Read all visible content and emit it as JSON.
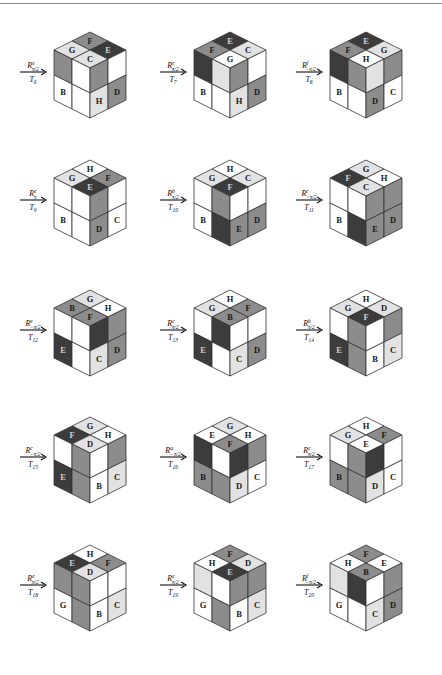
{
  "header": {
    "running_head": "' '  '"
  },
  "palette": {
    "W": "#ffffff",
    "L": "#e2e2e2",
    "M": "#8c8c8c",
    "D": "#3c3c3c",
    "stroke": "#333333",
    "text": "#1a1a1a"
  },
  "layout": {
    "col_x": [
      90,
      230,
      366
    ],
    "row_y": [
      32,
      160,
      290,
      417,
      545
    ],
    "half_width": 36,
    "top_half_height": 18,
    "side_height": 50
  },
  "panels": [
    {
      "id": "T6",
      "operator": "R^e_{π/2}",
      "op_base": "R",
      "op_sup": "e",
      "op_sub": "π/2",
      "transform": "T",
      "transform_sub": "6",
      "top": [
        {
          "c": "F",
          "f": "M",
          "l": "F"
        },
        {
          "c": "D",
          "f": "D",
          "l": "E"
        },
        {
          "c": "L",
          "f": "L",
          "l": "G"
        },
        {
          "c": "L",
          "f": "L",
          "l": "C"
        }
      ],
      "left": [
        {
          "f": "M",
          "l": ""
        },
        {
          "f": "W",
          "l": ""
        },
        {
          "f": "W",
          "l": "B"
        },
        {
          "f": "W",
          "l": ""
        }
      ],
      "right": [
        {
          "f": "M",
          "l": ""
        },
        {
          "f": "W",
          "l": ""
        },
        {
          "f": "L",
          "l": "H"
        },
        {
          "f": "M",
          "l": "D"
        }
      ]
    },
    {
      "id": "T7",
      "operator": "R^c_{π/2}",
      "op_base": "R",
      "op_sup": "c",
      "op_sub": "π/2",
      "transform": "T",
      "transform_sub": "7",
      "top": [
        {
          "f": "D",
          "l": "E"
        },
        {
          "f": "L",
          "l": "C"
        },
        {
          "f": "M",
          "l": "F"
        },
        {
          "f": "W",
          "l": "G"
        }
      ],
      "left": [
        {
          "f": "D",
          "l": ""
        },
        {
          "f": "L",
          "l": ""
        },
        {
          "f": "W",
          "l": "B"
        },
        {
          "f": "W",
          "l": ""
        }
      ],
      "right": [
        {
          "f": "M",
          "l": ""
        },
        {
          "f": "W",
          "l": ""
        },
        {
          "f": "L",
          "l": "H"
        },
        {
          "f": "M",
          "l": "D"
        }
      ]
    },
    {
      "id": "T8",
      "operator": "R^f_{-π/2}",
      "op_base": "R",
      "op_sup": "f",
      "op_sub": "−π/2",
      "transform": "T",
      "transform_sub": "8",
      "top": [
        {
          "f": "D",
          "l": "E"
        },
        {
          "f": "L",
          "l": "G"
        },
        {
          "f": "M",
          "l": "F"
        },
        {
          "f": "W",
          "l": "H"
        }
      ],
      "left": [
        {
          "f": "D",
          "l": ""
        },
        {
          "f": "M",
          "l": ""
        },
        {
          "f": "W",
          "l": "B"
        },
        {
          "f": "W",
          "l": ""
        }
      ],
      "right": [
        {
          "f": "L",
          "l": ""
        },
        {
          "f": "M",
          "l": ""
        },
        {
          "f": "M",
          "l": "D"
        },
        {
          "f": "W",
          "l": "C"
        }
      ]
    },
    {
      "id": "T9",
      "operator": "R^e_{π}",
      "op_base": "R",
      "op_sup": "e",
      "op_sub": "π",
      "transform": "T",
      "transform_sub": "9",
      "top": [
        {
          "f": "W",
          "l": "H"
        },
        {
          "f": "M",
          "l": "F"
        },
        {
          "f": "L",
          "l": "G"
        },
        {
          "f": "D",
          "l": "E"
        }
      ],
      "left": [
        {
          "f": "W",
          "l": ""
        },
        {
          "f": "W",
          "l": ""
        },
        {
          "f": "W",
          "l": "B"
        },
        {
          "f": "W",
          "l": ""
        }
      ],
      "right": [
        {
          "f": "M",
          "l": ""
        },
        {
          "f": "W",
          "l": ""
        },
        {
          "f": "M",
          "l": "D"
        },
        {
          "f": "W",
          "l": "C"
        }
      ]
    },
    {
      "id": "T10",
      "operator": "R^b_{π/2}",
      "op_base": "R",
      "op_sup": "b",
      "op_sub": "π/2",
      "transform": "T",
      "transform_sub": "10",
      "top": [
        {
          "f": "W",
          "l": "H"
        },
        {
          "f": "L",
          "l": "C"
        },
        {
          "f": "L",
          "l": "G"
        },
        {
          "f": "D",
          "l": "F"
        }
      ],
      "left": [
        {
          "f": "W",
          "l": ""
        },
        {
          "f": "M",
          "l": ""
        },
        {
          "f": "W",
          "l": "B"
        },
        {
          "f": "D",
          "l": ""
        }
      ],
      "right": [
        {
          "f": "W",
          "l": ""
        },
        {
          "f": "W",
          "l": ""
        },
        {
          "f": "M",
          "l": "E"
        },
        {
          "f": "M",
          "l": "D"
        }
      ]
    },
    {
      "id": "T11",
      "operator": "R^c_{-π/2}",
      "op_base": "R",
      "op_sup": "c",
      "op_sub": "−π/2",
      "transform": "T",
      "transform_sub": "11",
      "top": [
        {
          "f": "L",
          "l": "G"
        },
        {
          "f": "W",
          "l": "H"
        },
        {
          "f": "D",
          "l": "F"
        },
        {
          "f": "L",
          "l": "C"
        }
      ],
      "left": [
        {
          "f": "W",
          "l": ""
        },
        {
          "f": "W",
          "l": ""
        },
        {
          "f": "W",
          "l": "B"
        },
        {
          "f": "D",
          "l": ""
        }
      ],
      "right": [
        {
          "f": "M",
          "l": ""
        },
        {
          "f": "M",
          "l": ""
        },
        {
          "f": "M",
          "l": "E"
        },
        {
          "f": "M",
          "l": "D"
        }
      ]
    },
    {
      "id": "T12",
      "operator": "R^e_{-π/2}",
      "op_base": "R",
      "op_sup": "e",
      "op_sub": "−π/2",
      "transform": "T",
      "transform_sub": "12",
      "top": [
        {
          "f": "L",
          "l": "G"
        },
        {
          "f": "W",
          "l": "H"
        },
        {
          "f": "M",
          "l": "B"
        },
        {
          "f": "M",
          "l": "F"
        }
      ],
      "left": [
        {
          "f": "W",
          "l": ""
        },
        {
          "f": "W",
          "l": ""
        },
        {
          "f": "D",
          "l": "E"
        },
        {
          "f": "W",
          "l": ""
        }
      ],
      "right": [
        {
          "f": "D",
          "l": ""
        },
        {
          "f": "M",
          "l": ""
        },
        {
          "f": "L",
          "l": "C"
        },
        {
          "f": "M",
          "l": "D"
        }
      ]
    },
    {
      "id": "T13",
      "operator": "R^c_{π/2}",
      "op_base": "R",
      "op_sup": "c",
      "op_sub": "π/2",
      "transform": "T",
      "transform_sub": "13",
      "top": [
        {
          "f": "W",
          "l": "H"
        },
        {
          "f": "M",
          "l": "F"
        },
        {
          "f": "L",
          "l": "G"
        },
        {
          "f": "M",
          "l": "B"
        }
      ],
      "left": [
        {
          "f": "W",
          "l": ""
        },
        {
          "f": "D",
          "l": ""
        },
        {
          "f": "D",
          "l": "E"
        },
        {
          "f": "W",
          "l": ""
        }
      ],
      "right": [
        {
          "f": "W",
          "l": ""
        },
        {
          "f": "W",
          "l": ""
        },
        {
          "f": "L",
          "l": "C"
        },
        {
          "f": "M",
          "l": "D"
        }
      ]
    },
    {
      "id": "T14",
      "operator": "R^b_{π/2}",
      "op_base": "R",
      "op_sup": "b",
      "op_sub": "π/2",
      "transform": "T",
      "transform_sub": "14",
      "top": [
        {
          "f": "W",
          "l": "H"
        },
        {
          "f": "L",
          "l": "D"
        },
        {
          "f": "L",
          "l": "G"
        },
        {
          "f": "D",
          "l": "F"
        }
      ],
      "left": [
        {
          "f": "W",
          "l": ""
        },
        {
          "f": "M",
          "l": ""
        },
        {
          "f": "D",
          "l": "E"
        },
        {
          "f": "M",
          "l": ""
        }
      ],
      "right": [
        {
          "f": "W",
          "l": ""
        },
        {
          "f": "M",
          "l": ""
        },
        {
          "f": "W",
          "l": "B"
        },
        {
          "f": "L",
          "l": "C"
        }
      ]
    },
    {
      "id": "T15",
      "operator": "R^c_{-π/2}",
      "op_base": "R",
      "op_sup": "c",
      "op_sub": "−π/2",
      "transform": "T",
      "transform_sub": "15",
      "top": [
        {
          "f": "L",
          "l": "G"
        },
        {
          "f": "W",
          "l": "H"
        },
        {
          "f": "D",
          "l": "F"
        },
        {
          "f": "L",
          "l": "D"
        }
      ],
      "left": [
        {
          "f": "W",
          "l": ""
        },
        {
          "f": "M",
          "l": ""
        },
        {
          "f": "D",
          "l": "E"
        },
        {
          "f": "M",
          "l": ""
        }
      ],
      "right": [
        {
          "f": "W",
          "l": ""
        },
        {
          "f": "M",
          "l": ""
        },
        {
          "f": "W",
          "l": "B"
        },
        {
          "f": "L",
          "l": "C"
        }
      ]
    },
    {
      "id": "T16",
      "operator": "R^a_{-π/2}",
      "op_base": "R",
      "op_sup": "a",
      "op_sub": "−π/2",
      "transform": "T",
      "transform_sub": "16",
      "top": [
        {
          "f": "L",
          "l": "G"
        },
        {
          "f": "W",
          "l": "H"
        },
        {
          "f": "W",
          "l": "E"
        },
        {
          "f": "M",
          "l": "F"
        }
      ],
      "left": [
        {
          "f": "D",
          "l": ""
        },
        {
          "f": "W",
          "l": ""
        },
        {
          "f": "M",
          "l": "B"
        },
        {
          "f": "M",
          "l": ""
        }
      ],
      "right": [
        {
          "f": "D",
          "l": ""
        },
        {
          "f": "M",
          "l": ""
        },
        {
          "f": "L",
          "l": "D"
        },
        {
          "f": "W",
          "l": "C"
        }
      ]
    },
    {
      "id": "T17",
      "operator": "R^c_{π/2}",
      "op_base": "R",
      "op_sup": "c",
      "op_sub": "π/2",
      "transform": "T",
      "transform_sub": "17",
      "top": [
        {
          "f": "W",
          "l": "H"
        },
        {
          "f": "M",
          "l": "F"
        },
        {
          "f": "L",
          "l": "G"
        },
        {
          "f": "W",
          "l": "E"
        }
      ],
      "left": [
        {
          "f": "W",
          "l": ""
        },
        {
          "f": "M",
          "l": ""
        },
        {
          "f": "M",
          "l": "B"
        },
        {
          "f": "M",
          "l": ""
        }
      ],
      "right": [
        {
          "f": "D",
          "l": ""
        },
        {
          "f": "W",
          "l": ""
        },
        {
          "f": "L",
          "l": "D"
        },
        {
          "f": "W",
          "l": "C"
        }
      ]
    },
    {
      "id": "T18",
      "operator": "R^e_{π/2}",
      "op_base": "R",
      "op_sup": "e",
      "op_sub": "π/2",
      "transform": "T",
      "transform_sub": "18",
      "top": [
        {
          "f": "W",
          "l": "H"
        },
        {
          "f": "M",
          "l": "F"
        },
        {
          "f": "D",
          "l": "E"
        },
        {
          "f": "L",
          "l": "D"
        }
      ],
      "left": [
        {
          "f": "M",
          "l": ""
        },
        {
          "f": "M",
          "l": ""
        },
        {
          "f": "W",
          "l": "G"
        },
        {
          "f": "M",
          "l": ""
        }
      ],
      "right": [
        {
          "f": "W",
          "l": ""
        },
        {
          "f": "W",
          "l": ""
        },
        {
          "f": "W",
          "l": "B"
        },
        {
          "f": "L",
          "l": "C"
        }
      ]
    },
    {
      "id": "T19",
      "operator": "R^e_{π/2}",
      "op_base": "R",
      "op_sup": "e",
      "op_sub": "π/2",
      "transform": "T",
      "transform_sub": "19",
      "top": [
        {
          "f": "M",
          "l": "F"
        },
        {
          "f": "L",
          "l": "D"
        },
        {
          "f": "W",
          "l": "H"
        },
        {
          "f": "D",
          "l": "E"
        }
      ],
      "left": [
        {
          "f": "L",
          "l": ""
        },
        {
          "f": "W",
          "l": ""
        },
        {
          "f": "W",
          "l": "G"
        },
        {
          "f": "M",
          "l": ""
        }
      ],
      "right": [
        {
          "f": "M",
          "l": ""
        },
        {
          "f": "M",
          "l": ""
        },
        {
          "f": "W",
          "l": "B"
        },
        {
          "f": "L",
          "l": "C"
        }
      ]
    },
    {
      "id": "T20",
      "operator": "R^f_{-π/2}",
      "op_base": "R",
      "op_sup": "f",
      "op_sub": "−π/2",
      "transform": "T",
      "transform_sub": "20",
      "top": [
        {
          "f": "M",
          "l": "F"
        },
        {
          "f": "W",
          "l": "E"
        },
        {
          "f": "W",
          "l": "H"
        },
        {
          "f": "M",
          "l": "B"
        }
      ],
      "left": [
        {
          "f": "L",
          "l": ""
        },
        {
          "f": "D",
          "l": ""
        },
        {
          "f": "W",
          "l": "G"
        },
        {
          "f": "W",
          "l": ""
        }
      ],
      "right": [
        {
          "f": "W",
          "l": ""
        },
        {
          "f": "M",
          "l": ""
        },
        {
          "f": "L",
          "l": "C"
        },
        {
          "f": "M",
          "l": "D"
        }
      ]
    }
  ]
}
